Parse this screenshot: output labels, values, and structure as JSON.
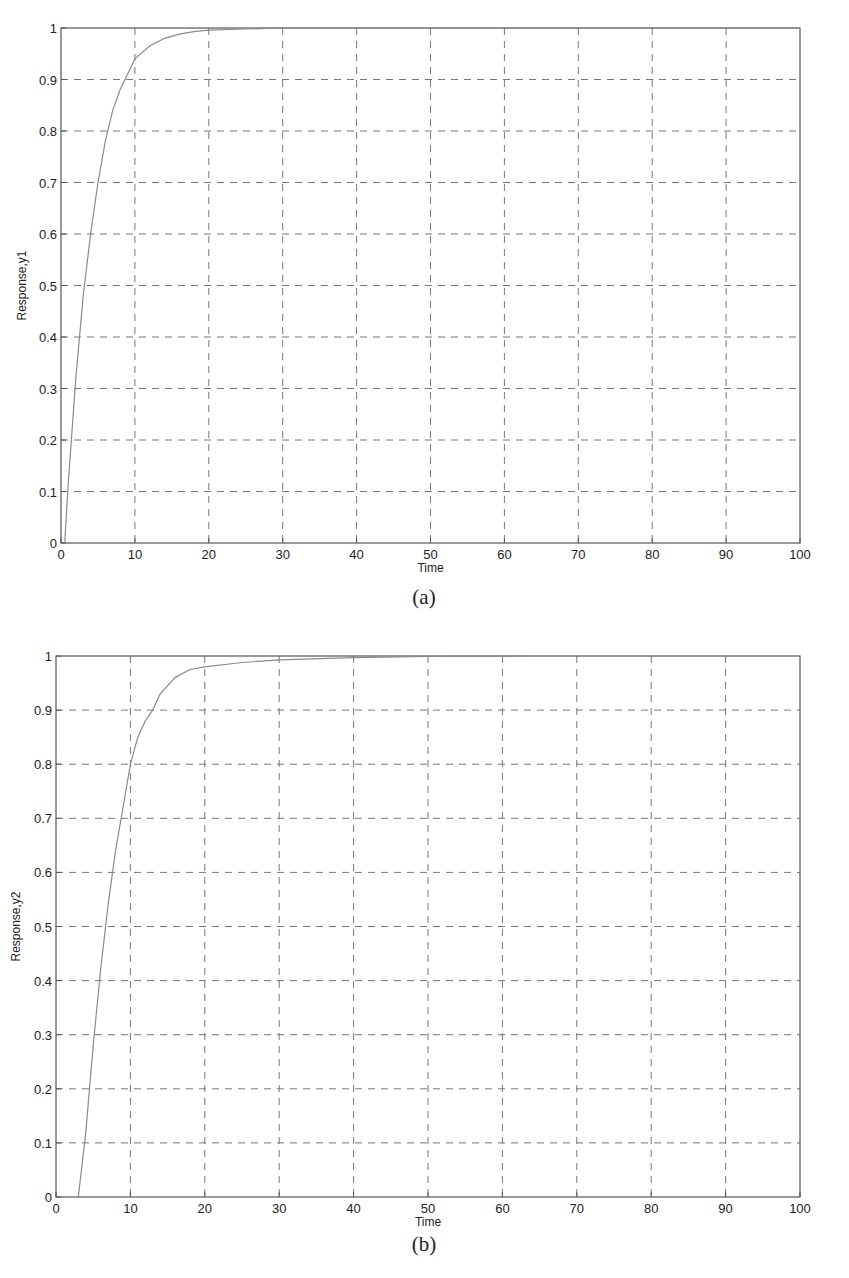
{
  "chart_data": [
    {
      "type": "line",
      "panel": "(a)",
      "title": "",
      "xlabel": "Time",
      "ylabel": "Response,y1",
      "xlim": [
        0,
        100
      ],
      "ylim": [
        0,
        1
      ],
      "xticks": [
        "0",
        "10",
        "20",
        "30",
        "40",
        "50",
        "60",
        "70",
        "80",
        "90",
        "100"
      ],
      "yticks": [
        "0",
        "0.1",
        "0.2",
        "0.3",
        "0.4",
        "0.5",
        "0.6",
        "0.7",
        "0.8",
        "0.9",
        "1"
      ],
      "grid": true,
      "legend": null,
      "series": [
        {
          "name": "y1",
          "x": [
            0.5,
            1,
            2,
            3,
            4,
            5,
            6,
            7,
            8,
            9,
            10,
            12,
            14,
            16,
            18,
            20,
            25,
            30,
            40,
            60,
            100
          ],
          "y": [
            0.0,
            0.12,
            0.32,
            0.48,
            0.6,
            0.7,
            0.78,
            0.84,
            0.88,
            0.91,
            0.94,
            0.965,
            0.98,
            0.988,
            0.993,
            0.996,
            0.998,
            1.0,
            1.0,
            1.0,
            1.0
          ]
        }
      ]
    },
    {
      "type": "line",
      "panel": "(b)",
      "title": "",
      "xlabel": "Time",
      "ylabel": "Response,y2",
      "xlim": [
        0,
        100
      ],
      "ylim": [
        0,
        1
      ],
      "xticks": [
        "0",
        "10",
        "20",
        "30",
        "40",
        "50",
        "60",
        "70",
        "80",
        "90",
        "100"
      ],
      "yticks": [
        "0",
        "0.1",
        "0.2",
        "0.3",
        "0.4",
        "0.5",
        "0.6",
        "0.7",
        "0.8",
        "0.9",
        "1"
      ],
      "grid": true,
      "legend": null,
      "series": [
        {
          "name": "y2",
          "x": [
            3,
            4,
            5,
            6,
            7,
            8,
            9,
            10,
            11,
            12,
            13,
            14,
            16,
            18,
            20,
            25,
            30,
            40,
            50,
            63
          ],
          "y": [
            0.0,
            0.12,
            0.28,
            0.42,
            0.54,
            0.64,
            0.72,
            0.8,
            0.85,
            0.88,
            0.9,
            0.93,
            0.96,
            0.975,
            0.98,
            0.988,
            0.993,
            0.997,
            0.999,
            1.0
          ]
        }
      ]
    }
  ],
  "figures": [
    {
      "caption": "(a)",
      "xlabel": "Time",
      "ylabel": "Response,y1"
    },
    {
      "caption": "(b)",
      "xlabel": "Time",
      "ylabel": "Response,y2"
    }
  ],
  "style": {
    "axis_color": "#555555",
    "grid_color": "#777777",
    "line_color": "#8a8a8a",
    "text_color": "#222222"
  }
}
